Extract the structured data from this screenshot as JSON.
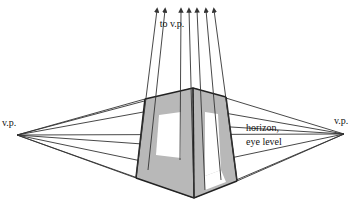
{
  "diagram": {
    "labels": {
      "left_vp": "v.p.",
      "right_vp": "v.p.",
      "top_vp": "to v.p.",
      "horizon_line1": "horizon,",
      "horizon_line2": "eye level"
    },
    "colors": {
      "face_fill": "#b8b8b8",
      "line": "#333333",
      "background": "#ffffff"
    }
  }
}
